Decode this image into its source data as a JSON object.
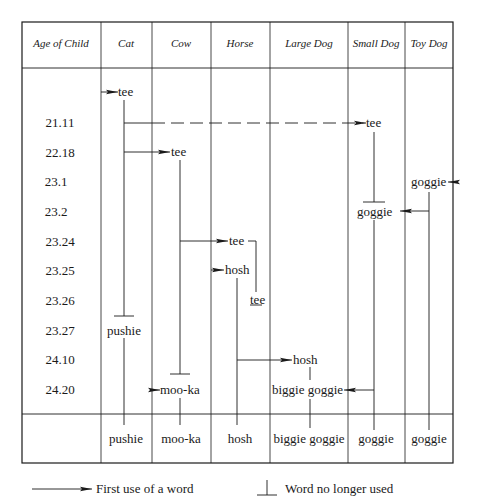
{
  "table": {
    "headers": [
      "Age of Child",
      "Cat",
      "Cow",
      "Horse",
      "Large Dog",
      "Small Dog",
      "Toy Dog"
    ],
    "ages": [
      "21.11",
      "22.18",
      "23.1",
      "23.2",
      "23.24",
      "23.25",
      "23.26",
      "23.27",
      "24.10",
      "24.20"
    ],
    "cells": {
      "cat_tee": "tee",
      "cat_pushie": "pushie",
      "cow_tee": "tee",
      "cow_mooka": "moo-ka",
      "horse_tee": "tee",
      "horse_hosh": "hosh",
      "horse_tee_end": "tee",
      "largedog_hosh": "hosh",
      "largedog_biggie": "biggie goggie",
      "smalldog_tee": "tee",
      "smalldog_goggie": "goggie",
      "toydog_goggie": "goggie"
    },
    "final_words": [
      "pushie",
      "moo-ka",
      "hosh",
      "biggie goggie",
      "goggie",
      "goggie"
    ]
  },
  "legend": {
    "arrow_label": "First use of a word",
    "stop_label": "Word no longer used"
  }
}
